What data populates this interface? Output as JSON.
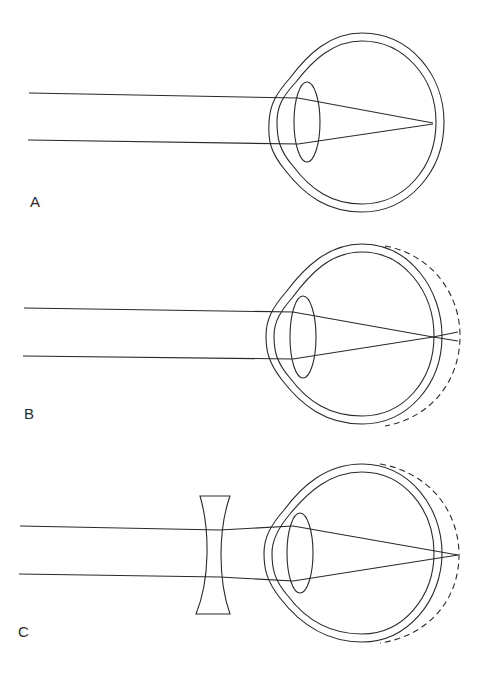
{
  "figure": {
    "panels": [
      {
        "id": "A",
        "label": "A",
        "caption": "Normal eye – parallel rays focus on the retina"
      },
      {
        "id": "B",
        "label": "B",
        "caption": "Elongated (myopic) eye – rays focus in front of the retina (dashed outline shows elongated globe)"
      },
      {
        "id": "C",
        "label": "C",
        "caption": "Myopic eye corrected with a concave lens – rays focus on the displaced retina"
      }
    ],
    "colors": {
      "line": "#2a2a2a",
      "background": "#ffffff"
    }
  }
}
